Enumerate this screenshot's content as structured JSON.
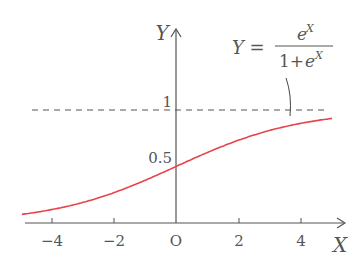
{
  "chart_data": {
    "type": "line",
    "title": "",
    "formula_label": {
      "lhs": "Y =",
      "numerator": "e^X",
      "denominator": "1+e^X"
    },
    "xlabel": "X",
    "ylabel": "Y",
    "origin_label": "O",
    "x_ticks": [
      -4,
      -2,
      0,
      2,
      4
    ],
    "x_tick_labels": [
      "−4",
      "−2",
      "O",
      "2",
      "4"
    ],
    "y_tick_labels": [
      "0.5",
      "1"
    ],
    "xlim": [
      -5,
      5
    ],
    "ylim": [
      0,
      1.1
    ],
    "grid": false,
    "asymptote": {
      "y": 1,
      "style": "dashed"
    },
    "series": [
      {
        "name": "logistic",
        "color": "#e8434a",
        "x": [
          -5,
          -4,
          -3,
          -2,
          -1,
          0,
          1,
          2,
          3,
          4,
          5
        ],
        "values": [
          0.007,
          0.018,
          0.047,
          0.119,
          0.269,
          0.5,
          0.731,
          0.881,
          0.953,
          0.982,
          0.993
        ]
      }
    ]
  }
}
